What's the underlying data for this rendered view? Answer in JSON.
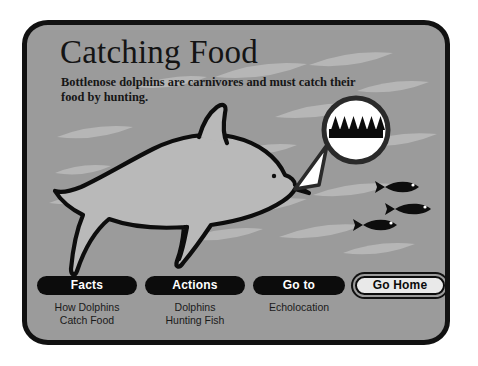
{
  "page": {
    "title": "Catching Food",
    "subtitle": "Bottlenose dolphins are carnivores and must catch their food by hunting."
  },
  "colors": {
    "frame_border": "#111111",
    "background": "#9b9b9b",
    "streak": "#b6b6b6",
    "dolphin_body": "#b9b9b9",
    "outline": "#0d0d0d",
    "button_fill": "#0c0c0c",
    "button_text": "#ffffff",
    "home_button_fill": "#e9e9e9",
    "home_button_text": "#0b0b0b",
    "caption_text": "#1a1a1a",
    "callout_fill": "#ffffff"
  },
  "artwork": {
    "dolphin_label": "bottlenose-dolphin",
    "magnifier_label": "magnified-teeth-circle",
    "teeth_count": 6,
    "fish_count": 3,
    "streak_count": 16
  },
  "nav": {
    "items": [
      {
        "label": "Facts",
        "caption": "How Dolphins\nCatch Food",
        "style": "filled",
        "name": "facts"
      },
      {
        "label": "Actions",
        "caption": "Dolphins\nHunting Fish",
        "style": "filled",
        "name": "actions"
      },
      {
        "label": "Go to",
        "caption": "Echolocation",
        "style": "filled",
        "name": "goto"
      },
      {
        "label": "Go Home",
        "caption": "",
        "style": "outlined",
        "name": "go-home"
      }
    ]
  }
}
